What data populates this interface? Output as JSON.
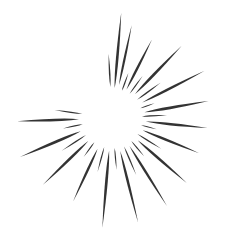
{
  "artwork": {
    "title": "Starburst",
    "type": "vector-illustration",
    "subject": "hand-drawn sunburst / star explosion",
    "width": 228,
    "height": 243,
    "background_color": "#ffffff",
    "ray_color": "#333333",
    "center": {
      "x": 112,
      "y": 118
    },
    "inner_void_radius": 28,
    "ray_count": 30,
    "rays": [
      {
        "id": "ray-01",
        "angle_deg": -85,
        "inner_radius": 30,
        "outer_radius": 106,
        "half_width": 2.6
      },
      {
        "id": "ray-02",
        "angle_deg": -78,
        "inner_radius": 34,
        "outer_radius": 95,
        "half_width": 2.2
      },
      {
        "id": "ray-03",
        "angle_deg": -70,
        "inner_radius": 29,
        "outer_radius": 48,
        "half_width": 1.3
      },
      {
        "id": "ray-04",
        "angle_deg": -63,
        "inner_radius": 32,
        "outer_radius": 88,
        "half_width": 2.4
      },
      {
        "id": "ray-05",
        "angle_deg": -54,
        "inner_radius": 30,
        "outer_radius": 52,
        "half_width": 1.2
      },
      {
        "id": "ray-06",
        "angle_deg": -46,
        "inner_radius": 33,
        "outer_radius": 100,
        "half_width": 2.7
      },
      {
        "id": "ray-07",
        "angle_deg": -36,
        "inner_radius": 31,
        "outer_radius": 60,
        "half_width": 1.5
      },
      {
        "id": "ray-08",
        "angle_deg": -27,
        "inner_radius": 34,
        "outer_radius": 104,
        "half_width": 2.5
      },
      {
        "id": "ray-09",
        "angle_deg": -19,
        "inner_radius": 30,
        "outer_radius": 45,
        "half_width": 1.1
      },
      {
        "id": "ray-10",
        "angle_deg": -10,
        "inner_radius": 33,
        "outer_radius": 98,
        "half_width": 2.8
      },
      {
        "id": "ray-11",
        "angle_deg": -3,
        "inner_radius": 30,
        "outer_radius": 55,
        "half_width": 1.3
      },
      {
        "id": "ray-12",
        "angle_deg": 6,
        "inner_radius": 34,
        "outer_radius": 96,
        "half_width": 2.6
      },
      {
        "id": "ray-13",
        "angle_deg": 14,
        "inner_radius": 30,
        "outer_radius": 46,
        "half_width": 1.1
      },
      {
        "id": "ray-14",
        "angle_deg": 22,
        "inner_radius": 33,
        "outer_radius": 94,
        "half_width": 2.5
      },
      {
        "id": "ray-15",
        "angle_deg": 32,
        "inner_radius": 30,
        "outer_radius": 58,
        "half_width": 1.4
      },
      {
        "id": "ray-16",
        "angle_deg": 41,
        "inner_radius": 34,
        "outer_radius": 99,
        "half_width": 2.6
      },
      {
        "id": "ray-17",
        "angle_deg": 50,
        "inner_radius": 30,
        "outer_radius": 50,
        "half_width": 1.2
      },
      {
        "id": "ray-18",
        "angle_deg": 58,
        "inner_radius": 33,
        "outer_radius": 104,
        "half_width": 2.4
      },
      {
        "id": "ray-19",
        "angle_deg": 67,
        "inner_radius": 31,
        "outer_radius": 62,
        "half_width": 1.4
      },
      {
        "id": "ray-20",
        "angle_deg": 76,
        "inner_radius": 34,
        "outer_radius": 108,
        "half_width": 2.5
      },
      {
        "id": "ray-21",
        "angle_deg": 85,
        "inner_radius": 30,
        "outer_radius": 52,
        "half_width": 1.2
      },
      {
        "id": "ray-22",
        "angle_deg": 95,
        "inner_radius": 33,
        "outer_radius": 110,
        "half_width": 2.7
      },
      {
        "id": "ray-23",
        "angle_deg": 105,
        "inner_radius": 30,
        "outer_radius": 56,
        "half_width": 1.3
      },
      {
        "id": "ray-24",
        "angle_deg": 115,
        "inner_radius": 34,
        "outer_radius": 92,
        "half_width": 2.4
      },
      {
        "id": "ray-25",
        "angle_deg": 126,
        "inner_radius": 30,
        "outer_radius": 48,
        "half_width": 1.2
      },
      {
        "id": "ray-26",
        "angle_deg": 136,
        "inner_radius": 33,
        "outer_radius": 96,
        "half_width": 2.6
      },
      {
        "id": "ray-27",
        "angle_deg": 147,
        "inner_radius": 31,
        "outer_radius": 60,
        "half_width": 1.4
      },
      {
        "id": "ray-28",
        "angle_deg": 157,
        "inner_radius": 34,
        "outer_radius": 100,
        "half_width": 2.8
      },
      {
        "id": "ray-29",
        "angle_deg": 168,
        "inner_radius": 30,
        "outer_radius": 50,
        "half_width": 1.2
      },
      {
        "id": "ray-30",
        "angle_deg": 178,
        "inner_radius": 33,
        "outer_radius": 95,
        "half_width": 2.6
      },
      {
        "id": "ray-31",
        "angle_deg": -93,
        "inner_radius": 31,
        "outer_radius": 64,
        "half_width": 1.5
      },
      {
        "id": "ray-32",
        "angle_deg": 188,
        "inner_radius": 30,
        "outer_radius": 58,
        "half_width": 1.3
      }
    ]
  }
}
